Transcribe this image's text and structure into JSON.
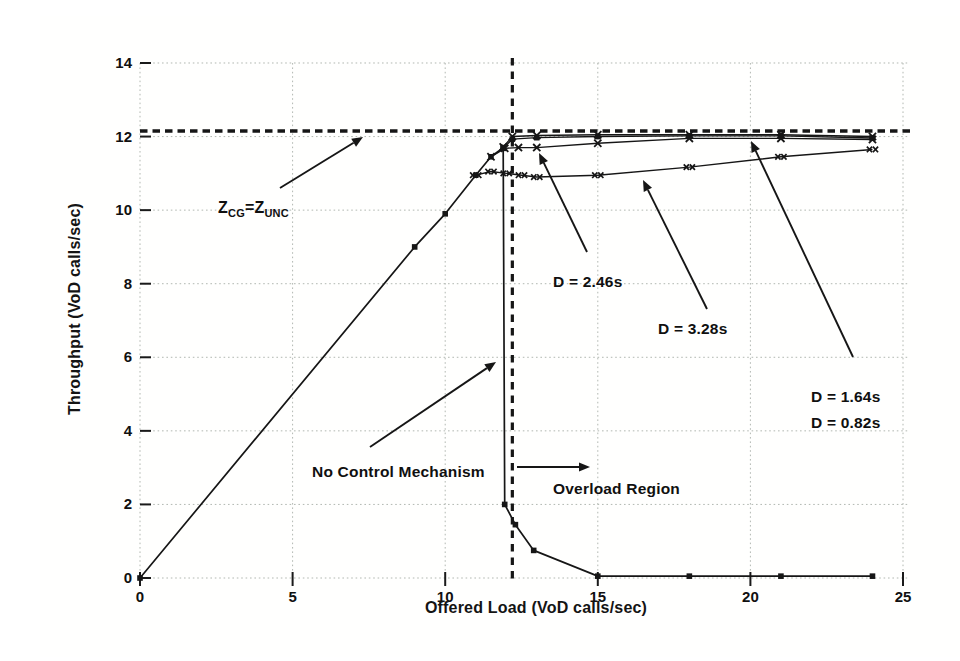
{
  "chart_data": {
    "type": "line",
    "title": "",
    "xlabel": "Offered Load (VoD calls/sec)",
    "ylabel": "Throughput (VoD calls/sec)",
    "xlim": [
      0,
      25
    ],
    "ylim": [
      0,
      14
    ],
    "xticks": [
      0,
      5,
      10,
      15,
      20,
      25
    ],
    "yticks": [
      0,
      2,
      4,
      6,
      8,
      10,
      12,
      14
    ],
    "grid": true,
    "legend_position": "none",
    "line_color": "#161616",
    "grid_color": "#b2b8b2",
    "reference_lines": [
      {
        "id": "capacity-line",
        "orientation": "horizontal",
        "value": 12.15,
        "style": "dashed",
        "meaning": "Z_CG = Z_UNC capacity level"
      },
      {
        "id": "overload-boundary",
        "orientation": "vertical",
        "value": 12.2,
        "style": "dashed",
        "meaning": "start of overload region"
      }
    ],
    "series": [
      {
        "name": "No Control Mechanism",
        "marker": "square",
        "x": [
          0,
          9,
          10,
          11,
          11.5,
          11.9,
          11.95,
          12.3,
          12.9,
          15,
          18,
          21,
          24
        ],
        "y": [
          0,
          9.0,
          9.9,
          10.95,
          11.45,
          11.7,
          2.0,
          1.45,
          0.75,
          0.05,
          0.05,
          0.05,
          0.05
        ]
      },
      {
        "name": "D = 0.82s",
        "marker": "x",
        "x": [
          11.9,
          12.2,
          13,
          15,
          18,
          21,
          24
        ],
        "y": [
          11.72,
          12.0,
          12.03,
          12.05,
          12.05,
          12.05,
          12.0
        ]
      },
      {
        "name": "D = 1.64s",
        "marker": "square",
        "x": [
          11.9,
          12.2,
          13,
          15,
          18,
          21,
          24
        ],
        "y": [
          11.68,
          11.93,
          11.97,
          12.0,
          12.02,
          12.02,
          11.96
        ]
      },
      {
        "name": "D = 2.46s",
        "marker": "x",
        "x": [
          11.5,
          11.95,
          12.4,
          13,
          15,
          18,
          21,
          24
        ],
        "y": [
          11.45,
          11.68,
          11.7,
          11.7,
          11.82,
          11.95,
          11.95,
          11.92
        ]
      },
      {
        "name": "D = 3.28s",
        "marker": "xx",
        "x": [
          11,
          11.5,
          12,
          12.5,
          13,
          15,
          18,
          21,
          24
        ],
        "y": [
          10.95,
          11.05,
          11.0,
          10.95,
          10.9,
          10.95,
          11.17,
          11.45,
          11.65
        ]
      }
    ],
    "annotations": [
      {
        "id": "z-equality",
        "text": "Z_CG=Z_UNC",
        "rich": [
          {
            "t": "Z"
          },
          {
            "t": "CG",
            "sub": true
          },
          {
            "t": "="
          },
          {
            "t": "Z"
          },
          {
            "t": "UNC",
            "sub": true
          }
        ],
        "px": 178,
        "py": 197,
        "arrow": {
          "x1": 240,
          "y1": 172,
          "x2": 323,
          "y2": 121
        }
      },
      {
        "id": "d-2-46",
        "text": "D = 2.46s",
        "px": 513,
        "py": 271,
        "arrow": {
          "x1": 547,
          "y1": 236,
          "x2": 499,
          "y2": 137
        }
      },
      {
        "id": "d-3-28",
        "text": "D = 3.28s",
        "px": 618,
        "py": 318,
        "arrow": {
          "x1": 667,
          "y1": 293,
          "x2": 603,
          "y2": 164
        }
      },
      {
        "id": "d-1-64-0-82",
        "lines": [
          "D = 1.64s",
          "D = 0.82s"
        ],
        "px": 771,
        "py": 386,
        "line_height": 26,
        "arrow": {
          "x1": 813,
          "y1": 341,
          "x2": 711,
          "y2": 125
        }
      },
      {
        "id": "no-control",
        "text": "No Control Mechanism",
        "px": 272,
        "py": 461,
        "arrow": {
          "x1": 330,
          "y1": 431,
          "x2": 456,
          "y2": 346
        }
      },
      {
        "id": "overload-region",
        "text": "Overload Region",
        "px": 513,
        "py": 478,
        "arrow": {
          "x1": 477,
          "y1": 451,
          "x2": 550,
          "y2": 451
        }
      }
    ]
  }
}
